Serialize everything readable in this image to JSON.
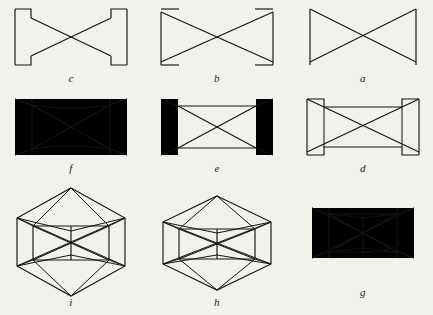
{
  "plate": {
    "background_color": "#f3f1ec",
    "ink_color": "#141414",
    "width": 433,
    "height": 315,
    "rows": 3,
    "columns": 3,
    "figure_count": 9
  },
  "figures": [
    {
      "label": "c",
      "row": 1,
      "column": 1,
      "name": "bowtie-with-corner-notches",
      "description": "Flat bowtie (hourglass) outline with small rectangular notches at all four corners"
    },
    {
      "label": "b",
      "row": 1,
      "column": 2,
      "name": "bowtie-with-corner-flags",
      "description": "Flat bowtie outline with short horizontal flags projecting inward at the four corners"
    },
    {
      "label": "a",
      "row": 1,
      "column": 3,
      "name": "plain-bowtie",
      "description": "Plain flat bowtie outline with two vertical end bars and crossing diagonals"
    },
    {
      "label": "f",
      "row": 2,
      "column": 1,
      "name": "prism-full-frame",
      "description": "Rectangular prism drawn in perspective containing an inner waisted hourglass band with crossing diagonals"
    },
    {
      "label": "e",
      "row": 2,
      "column": 2,
      "name": "prism-with-end-flanges",
      "description": "Rectangular prism with tall vertical flanges at each end and crossing interior diagonals"
    },
    {
      "label": "d",
      "row": 2,
      "column": 3,
      "name": "prism-with-corner-notches",
      "description": "Rectangular prism with square notches cut from the four corners and crossing diagonals"
    },
    {
      "label": "i",
      "row": 3,
      "column": 1,
      "name": "hexagonal-prism-tall",
      "description": "Tall hexagonal prism in perspective with apexes top and bottom, central vertical member and X bracing"
    },
    {
      "label": "h",
      "row": 3,
      "column": 2,
      "name": "hexagonal-prism-wide",
      "description": "Wide hexagonal prism in perspective with shallow top and bottom apexes, central vertical member and X bracing"
    },
    {
      "label": "g",
      "row": 3,
      "column": 3,
      "name": "bowtie-prism",
      "description": "Three dimensional bowtie prism with end faces, waisted centre, central vertical member and X bracing"
    }
  ]
}
